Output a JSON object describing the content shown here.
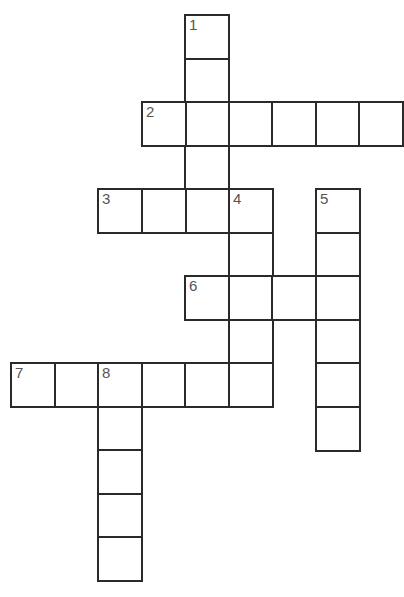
{
  "puzzle": {
    "type": "crossword",
    "cell_size": 43.5,
    "origin": {
      "x": 11,
      "y": 15
    },
    "line_color": "#2a2a2a",
    "number_color": "#555555",
    "entries": [
      {
        "number": "1",
        "direction": "down",
        "col": 4,
        "row": 0,
        "length": 5
      },
      {
        "number": "2",
        "direction": "across",
        "col": 3,
        "row": 2,
        "length": 6
      },
      {
        "number": "3",
        "direction": "across",
        "col": 2,
        "row": 4,
        "length": 4
      },
      {
        "number": "4",
        "direction": "down",
        "col": 5,
        "row": 4,
        "length": 5
      },
      {
        "number": "5",
        "direction": "down",
        "col": 7,
        "row": 4,
        "length": 6
      },
      {
        "number": "6",
        "direction": "across",
        "col": 4,
        "row": 6,
        "length": 4
      },
      {
        "number": "7",
        "direction": "across",
        "col": 0,
        "row": 8,
        "length": 6
      },
      {
        "number": "8",
        "direction": "down",
        "col": 2,
        "row": 8,
        "length": 5
      }
    ]
  }
}
